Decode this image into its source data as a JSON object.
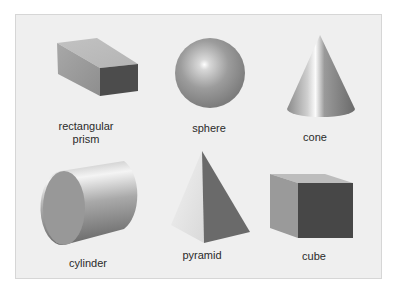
{
  "figure": {
    "background": "#efefef",
    "border_color": "#d6d6d6",
    "shapes": [
      {
        "id": "rectangular-prism",
        "label_line1": "rectangular",
        "label_line2": "prism"
      },
      {
        "id": "sphere",
        "label": "sphere"
      },
      {
        "id": "cone",
        "label": "cone"
      },
      {
        "id": "cylinder",
        "label": "cylinder"
      },
      {
        "id": "pyramid",
        "label": "pyramid"
      },
      {
        "id": "cube",
        "label": "cube"
      }
    ]
  }
}
